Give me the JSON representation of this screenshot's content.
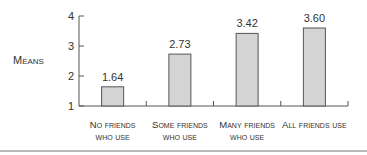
{
  "chart_data": {
    "type": "bar",
    "title": "",
    "xlabel": "",
    "ylabel": "Means",
    "ylim": [
      1,
      4
    ],
    "yticks": [
      1,
      2,
      3,
      4
    ],
    "grid": false,
    "legend": null,
    "categories": [
      [
        "No friends",
        "who use"
      ],
      [
        "Some friends",
        "who use"
      ],
      [
        "Many friends",
        "who use"
      ],
      [
        "All friends use"
      ]
    ],
    "values": [
      1.64,
      2.73,
      3.42,
      3.6
    ],
    "value_labels": [
      "1.64",
      "2.73",
      "3.42",
      "3.60"
    ],
    "bar_color": "#d4d4d4",
    "bar_stroke": "#555555"
  }
}
